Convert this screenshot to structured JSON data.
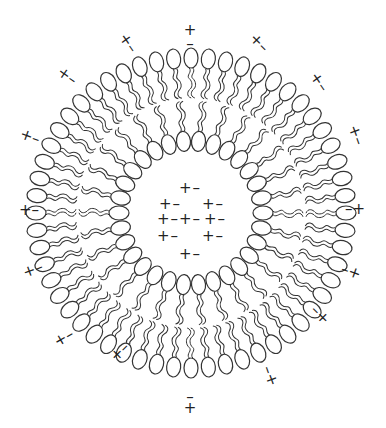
{
  "diagram": {
    "center": [
      191,
      213
    ],
    "outer_leaflet": {
      "count": 56,
      "head_radius": 155,
      "tail_inward": true
    },
    "inner_leaflet": {
      "count": 30,
      "head_radius": 72,
      "tail_outward": true
    },
    "stroke_color": "#333333",
    "outer_charges": [
      {
        "label": "+",
        "x": 190,
        "y": 30
      },
      {
        "label": "-",
        "x": 190,
        "y": 44
      },
      {
        "label": "+-",
        "x": 259,
        "y": 43,
        "rot": 45
      },
      {
        "label": "+-",
        "x": 319,
        "y": 82,
        "rot": 55
      },
      {
        "label": "+-",
        "x": 356,
        "y": 135,
        "rot": 70
      },
      {
        "label": "-+",
        "x": 355,
        "y": 209
      },
      {
        "label": "-+",
        "x": 351,
        "y": 272,
        "rot": 20
      },
      {
        "label": "-+",
        "x": 320,
        "y": 315,
        "rot": 45
      },
      {
        "label": "-+",
        "x": 270,
        "y": 376,
        "rot": 70
      },
      {
        "label": "-",
        "x": 190,
        "y": 397
      },
      {
        "label": "+",
        "x": 190,
        "y": 408
      },
      {
        "label": "+-",
        "x": 120,
        "y": 352,
        "rot": -45
      },
      {
        "label": "+-",
        "x": 64,
        "y": 338,
        "rot": -30
      },
      {
        "label": "+-",
        "x": 33,
        "y": 270,
        "rot": -20
      },
      {
        "label": "+-",
        "x": 29,
        "y": 210
      },
      {
        "label": "+-",
        "x": 30,
        "y": 137,
        "rot": 20
      },
      {
        "label": "+-",
        "x": 67,
        "y": 76,
        "rot": 35
      },
      {
        "label": "+-",
        "x": 128,
        "y": 43,
        "rot": 55
      }
    ],
    "inner_charges": [
      {
        "label": "+-",
        "x": 190,
        "y": 188
      },
      {
        "label": "+-",
        "x": 170,
        "y": 204
      },
      {
        "label": "+-",
        "x": 213,
        "y": 204
      },
      {
        "label": "+-",
        "x": 168,
        "y": 219
      },
      {
        "label": "+-",
        "x": 190,
        "y": 219
      },
      {
        "label": "+-",
        "x": 215,
        "y": 219
      },
      {
        "label": "+-",
        "x": 168,
        "y": 236
      },
      {
        "label": "+-",
        "x": 213,
        "y": 236
      },
      {
        "label": "+-",
        "x": 190,
        "y": 254
      }
    ]
  }
}
